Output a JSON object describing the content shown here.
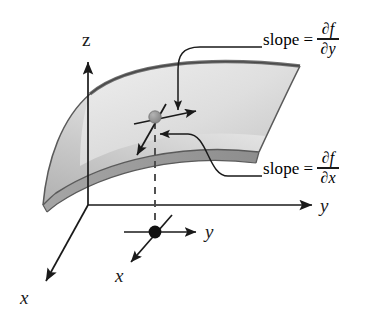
{
  "figure": {
    "background_color": "#ffffff",
    "line_color": "#1a1a1a",
    "surface_fill_light": "#e6e6e6",
    "surface_fill_mid": "#b9b9b9",
    "surface_fill_dark": "#9a9a9a",
    "surface_band_color": "#8f8f8f",
    "surface_point_color": "#8a8a8a",
    "plane_point_color": "#111111"
  },
  "axes": {
    "z_label": "z",
    "y_label": "y",
    "x_label": "x"
  },
  "plane_point": {
    "y_label": "y",
    "x_label": "x"
  },
  "annotations": {
    "top": {
      "word": "slope",
      "equals": "=",
      "numerator": "∂f",
      "denominator": "∂y"
    },
    "bottom": {
      "word": "slope",
      "equals": "=",
      "numerator": "∂f",
      "denominator": "∂x"
    }
  }
}
